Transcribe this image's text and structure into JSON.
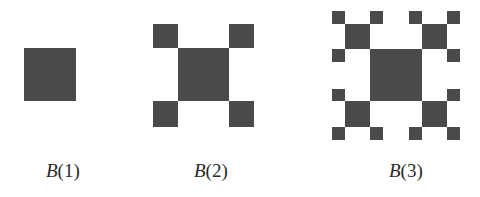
{
  "figures": [
    {
      "id": "B1",
      "name": "B",
      "arg": "(1)",
      "label_left": 46
    },
    {
      "id": "B2",
      "name": "B",
      "arg": "(2)",
      "label_left": 194
    },
    {
      "id": "B3",
      "name": "B",
      "arg": "(3)",
      "label_left": 389
    }
  ],
  "colors": {
    "fill": "#4a4a4a",
    "background": "#ffffff"
  }
}
